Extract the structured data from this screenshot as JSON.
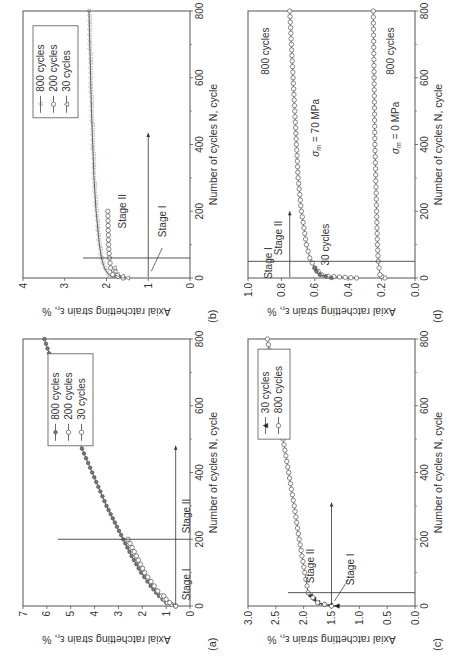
{
  "chart_data": [
    {
      "panel": "(a)",
      "type": "line",
      "xlabel": "Number of cycles N, cycle",
      "ylabel": "Axial ratchetting strain εr, %",
      "xlim": [
        0,
        800
      ],
      "ylim": [
        0,
        7
      ],
      "xticks": [
        0,
        200,
        400,
        600,
        800
      ],
      "yticks": [
        0,
        1,
        2,
        3,
        4,
        5,
        6,
        7
      ],
      "legend": [
        "800 cycles",
        "200 cycles",
        "30 cycles"
      ],
      "series": [
        {
          "name": "800 cycles",
          "marker": "filled-circle",
          "x": [
            0,
            10,
            30,
            60,
            100,
            150,
            200,
            250,
            300,
            400,
            500,
            600,
            700,
            800
          ],
          "y": [
            0.6,
            1.0,
            1.3,
            1.65,
            2.05,
            2.45,
            2.8,
            3.15,
            3.5,
            4.1,
            4.7,
            5.2,
            5.65,
            6.1
          ]
        },
        {
          "name": "200 cycles",
          "marker": "open-circle",
          "x": [
            0,
            10,
            30,
            60,
            100,
            150,
            200
          ],
          "y": [
            0.6,
            0.95,
            1.2,
            1.5,
            1.9,
            2.25,
            2.6
          ]
        },
        {
          "name": "30 cycles",
          "marker": "open-circle",
          "x": [
            0,
            10,
            20,
            30
          ],
          "y": [
            0.6,
            0.85,
            1.0,
            1.1
          ]
        }
      ],
      "annotations": [
        "Stage I",
        "Stage II"
      ],
      "stage_boundary_x": 200
    },
    {
      "panel": "(b)",
      "type": "line",
      "xlabel": "Number of cycles N, cycle",
      "ylabel": "Axial ratchetting strain εr, %",
      "xlim": [
        0,
        800
      ],
      "ylim": [
        0,
        4
      ],
      "xticks": [
        0,
        200,
        400,
        600,
        800
      ],
      "yticks": [
        0,
        1,
        2,
        3,
        4
      ],
      "legend": [
        "800 cycles",
        "200 cycles",
        "30 cycles"
      ],
      "series": [
        {
          "name": "800 cycles",
          "marker": "star",
          "x": [
            0,
            5,
            10,
            30,
            60,
            100,
            200,
            300,
            400,
            500,
            600,
            700,
            800
          ],
          "y": [
            1.6,
            1.85,
            1.95,
            2.05,
            2.12,
            2.17,
            2.25,
            2.3,
            2.33,
            2.36,
            2.38,
            2.4,
            2.42
          ]
        },
        {
          "name": "200 cycles",
          "marker": "open-circle",
          "x": [
            0,
            10,
            30,
            60,
            100,
            200
          ],
          "y": [
            1.6,
            1.85,
            1.9,
            1.93,
            1.95,
            1.97
          ]
        },
        {
          "name": "30 cycles",
          "marker": "triangle",
          "x": [
            0,
            10,
            20,
            30
          ],
          "y": [
            1.5,
            1.75,
            1.8,
            1.82
          ]
        }
      ],
      "annotations": [
        "Stage I",
        "Stage II"
      ],
      "stage_boundary_x": 60
    },
    {
      "panel": "(c)",
      "type": "line",
      "xlabel": "Number of cycles N, cycle",
      "ylabel": "Axial ratchetting strain εr, %",
      "xlim": [
        0,
        800
      ],
      "ylim": [
        0,
        3.0
      ],
      "xticks": [
        0,
        200,
        400,
        600,
        800
      ],
      "yticks": [
        0.0,
        0.5,
        1.0,
        1.5,
        2.0,
        2.5,
        3.0
      ],
      "legend": [
        "30 cycles",
        "800 cycles"
      ],
      "series": [
        {
          "name": "30 cycles",
          "marker": "filled-triangle",
          "x": [
            0,
            5,
            10,
            20,
            30
          ],
          "y": [
            1.4,
            1.65,
            1.75,
            1.82,
            1.88
          ]
        },
        {
          "name": "800 cycles",
          "marker": "open-circle",
          "x": [
            0,
            10,
            40,
            100,
            200,
            300,
            400,
            500,
            600,
            700,
            800
          ],
          "y": [
            1.5,
            1.75,
            1.92,
            1.98,
            2.08,
            2.17,
            2.27,
            2.37,
            2.46,
            2.55,
            2.65
          ]
        }
      ],
      "annotations": [
        "Stage I",
        "Stage II"
      ],
      "stage_boundary_x": 40
    },
    {
      "panel": "(d)",
      "type": "line",
      "xlabel": "Number of cycles N, cycle",
      "ylabel": "Axial ratchetting strain εr, %",
      "xlim": [
        0,
        800
      ],
      "ylim": [
        0.0,
        1.0
      ],
      "xticks": [
        0,
        200,
        400,
        600,
        800
      ],
      "yticks": [
        0.0,
        0.2,
        0.4,
        0.6,
        0.8,
        1.0
      ],
      "series": [
        {
          "name": "σm = 70 MPa, 800 cycles",
          "marker": "open-circle",
          "x": [
            0,
            5,
            10,
            30,
            60,
            100,
            200,
            300,
            400,
            500,
            600,
            700,
            800
          ],
          "y": [
            0.35,
            0.52,
            0.56,
            0.6,
            0.63,
            0.65,
            0.68,
            0.7,
            0.71,
            0.72,
            0.73,
            0.74,
            0.75
          ]
        },
        {
          "name": "σm = 70 MPa, 30 cycles",
          "marker": "filled-circle",
          "x": [
            0,
            10,
            20,
            30
          ],
          "y": [
            0.5,
            0.57,
            0.59,
            0.6
          ]
        },
        {
          "name": "σm = 0 MPa, 800 cycles",
          "marker": "open-circle",
          "x": [
            0,
            5,
            10,
            50,
            100,
            200,
            400,
            600,
            800
          ],
          "y": [
            0.18,
            0.2,
            0.21,
            0.22,
            0.225,
            0.23,
            0.24,
            0.245,
            0.25
          ]
        }
      ],
      "annotations": [
        "Stage I",
        "Stage II",
        "30 cycles",
        "800 cycles",
        "σm = 70 MPa",
        "800 cycles",
        "σm = 0 MPa"
      ],
      "stage_boundary_x": 50
    }
  ],
  "labels": {
    "a": "(a)",
    "b": "(b)",
    "c": "(c)",
    "d": "(d)",
    "xlabel": "Number of cycles N, cycle",
    "ylabel_main": "Axial ratchetting strain ε",
    "ylabel_sub": "r",
    "ylabel_unit": ", %",
    "stage1": "Stage I",
    "stage2": "Stage II",
    "c800": "800 cycles",
    "c200": "200 cycles",
    "c30": "30 cycles",
    "sigma70": "σ",
    "sigma70_sub": "m",
    "sigma70_val": " = 70 MPa",
    "sigma0_val": " = 0 MPa"
  }
}
